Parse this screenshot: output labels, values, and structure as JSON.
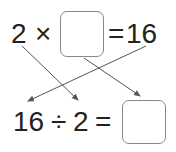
{
  "equation_top": {
    "left": "2",
    "op": "×",
    "answer_box": "",
    "equals": "=",
    "result": "16"
  },
  "equation_bottom": {
    "left": "16",
    "op": "÷",
    "right": "2",
    "equals": "=",
    "answer_box": ""
  },
  "arrows": [
    {
      "from": "top-2",
      "to": "bottom-2"
    },
    {
      "from": "top-box",
      "to": "bottom-box"
    },
    {
      "from": "top-16",
      "to": "bottom-16"
    }
  ],
  "colors": {
    "text": "#222222",
    "arrow": "#555555",
    "box_border": "#888888"
  }
}
